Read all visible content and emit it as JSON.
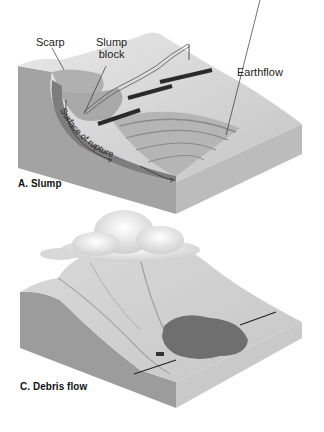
{
  "panels": [
    {
      "id": "A",
      "caption": "A. Slump",
      "labels": {
        "scarp": "Scarp",
        "slump_block": "Slump\nblock",
        "slump_block_line1": "Slump",
        "slump_block_line2": "block",
        "earthflow": "Earthflow",
        "surface_of_rupture": "Surface of rupture"
      }
    },
    {
      "id": "C",
      "caption": "C. Debris flow"
    }
  ],
  "colors": {
    "block_side": "#9a9a9a",
    "block_front": "#bdbdbd",
    "surface": "#d6d6d6",
    "rupture": "#7a7a7a",
    "debris": "#6e6e6e",
    "road": "#2a2a2a"
  }
}
